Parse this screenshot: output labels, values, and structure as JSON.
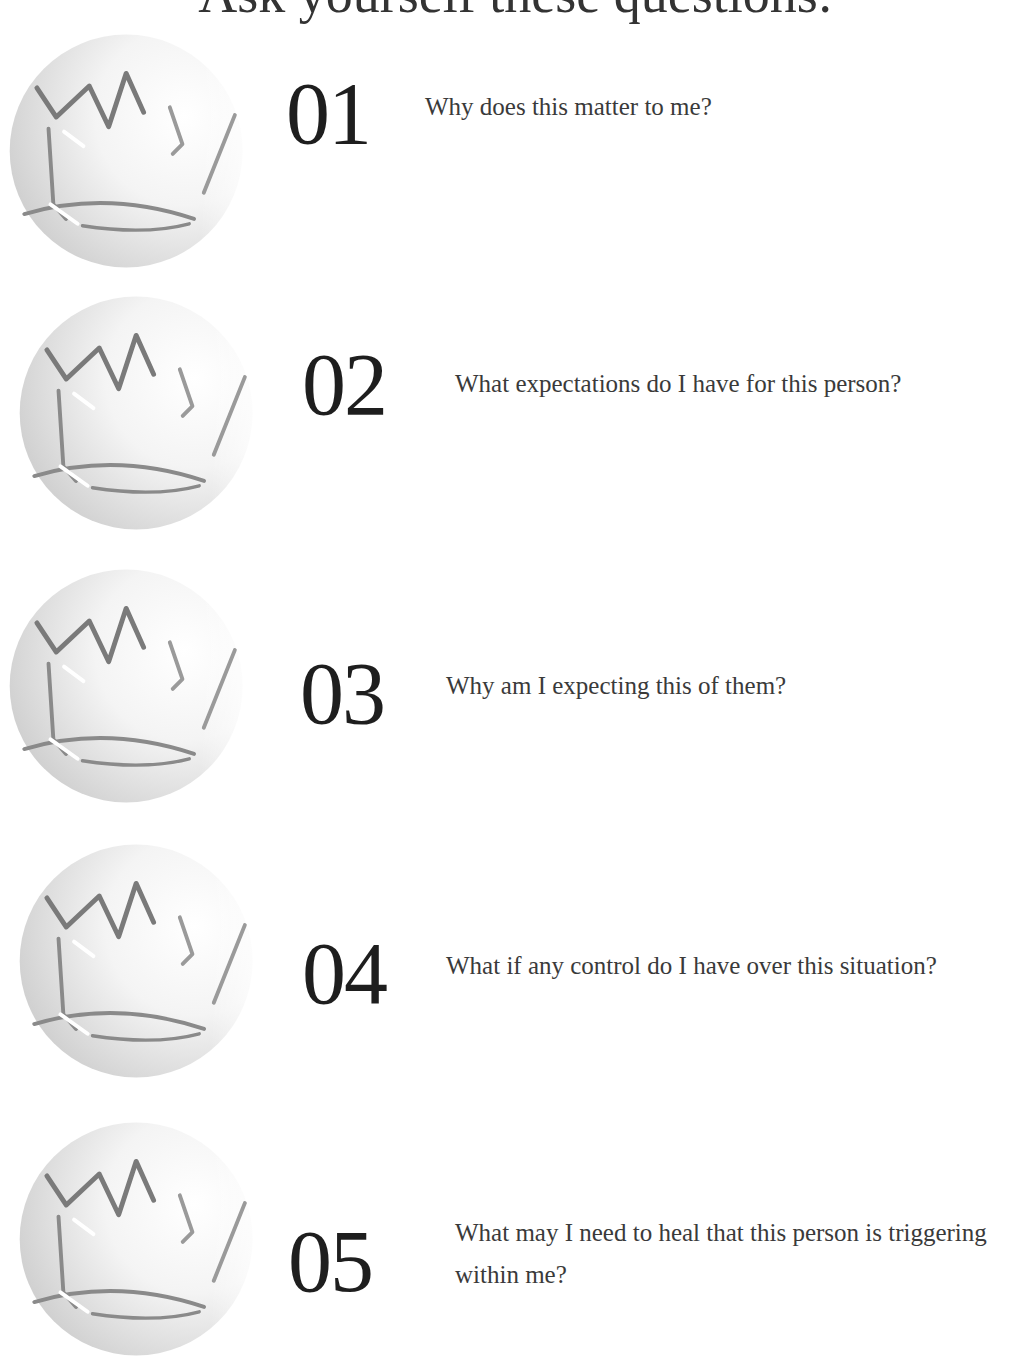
{
  "header": {
    "title": "Ask yourself these questions:"
  },
  "icon": {
    "name": "crown-icon",
    "stroke_color": "#8a8a8a",
    "sphere_shade": "#cfcfcf"
  },
  "items": [
    {
      "number": "01",
      "question": "Why does this matter to me?"
    },
    {
      "number": "02",
      "question": "What expectations do I have for this person?"
    },
    {
      "number": "03",
      "question": "Why am I expecting this of them?"
    },
    {
      "number": "04",
      "question": "What if any control do I have over this situation?"
    },
    {
      "number": "05",
      "question": "What may I need to heal that this person is triggering within me?"
    }
  ]
}
